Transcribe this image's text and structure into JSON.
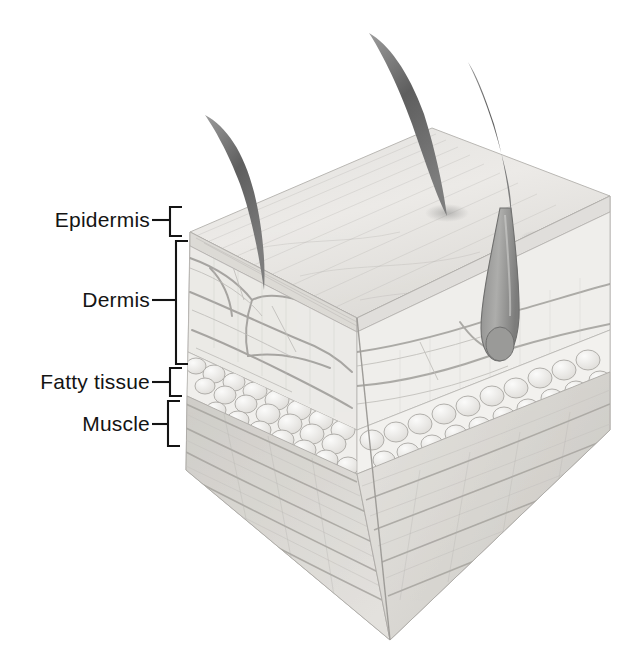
{
  "figure": {
    "background_color": "#ffffff",
    "ink_color": "#141414",
    "label_font_size_px": 21
  },
  "labels": [
    {
      "id": "epidermis",
      "text": "Epidermis",
      "text_right_px": 150,
      "text_y_px": 220,
      "leader": {
        "x1": 152,
        "x2": 170,
        "y": 220
      },
      "bracket": {
        "x": 170,
        "y_top": 207,
        "y_bottom": 236,
        "tick": 12
      }
    },
    {
      "id": "dermis",
      "text": "Dermis",
      "text_right_px": 150,
      "text_y_px": 300,
      "leader": {
        "x1": 152,
        "x2": 176,
        "y": 300
      },
      "bracket": {
        "x": 176,
        "y_top": 241,
        "y_bottom": 364,
        "tick": 10
      }
    },
    {
      "id": "fatty-tissue",
      "text": "Fatty tissue",
      "text_right_px": 150,
      "text_y_px": 382,
      "leader": {
        "x1": 152,
        "x2": 170,
        "y": 382
      },
      "bracket": {
        "x": 170,
        "y_top": 368,
        "y_bottom": 396,
        "tick": 12
      }
    },
    {
      "id": "muscle",
      "text": "Muscle",
      "text_right_px": 150,
      "text_y_px": 424,
      "leader": {
        "x1": 152,
        "x2": 168,
        "y": 424
      },
      "bracket": {
        "x": 168,
        "y_top": 401,
        "y_bottom": 446,
        "tick": 12
      }
    }
  ],
  "block": {
    "description": "Three-dimensional cut-away cube of skin tissue drawn in pencil shading, viewed from above-left",
    "top_face": {
      "corners": "(190,232) (432,128) (610,196) (357,318)"
    },
    "left_face": {
      "corners": "(190,232) (357,318) (390,640) (186,470)"
    },
    "right_face": {
      "corners": "(357,318) (610,196) (610,430) (390,640)"
    },
    "layers": [
      {
        "name": "Epidermis",
        "order": 1,
        "depth_band": "thin surface band",
        "fill": "#e9e9e7"
      },
      {
        "name": "Dermis",
        "order": 2,
        "depth_band": "thick band with blood vessels and hair follicle",
        "fill": "#f0efed"
      },
      {
        "name": "Fatty tissue",
        "order": 3,
        "depth_band": "band of rounded fat globules",
        "fill": "#f3f2f0"
      },
      {
        "name": "Muscle",
        "order": 4,
        "depth_band": "striated fibre bands at base",
        "fill": "#dedcd8"
      }
    ],
    "features": {
      "hairs_above_surface": 3,
      "hair_follicle_with_bulb": 1,
      "blood_vessel_network": true,
      "fat_globules": true,
      "muscle_striations": true
    }
  }
}
